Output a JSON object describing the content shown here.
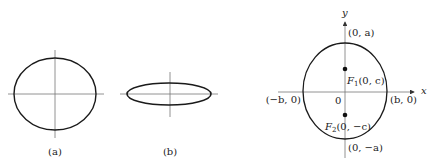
{
  "figures": {
    "a": {
      "label": "(a)",
      "center": [
        55,
        94
      ],
      "rx": 41,
      "ry": 36,
      "axes": {
        "h": [
          8,
          104
        ],
        "v": [
          50,
          138
        ]
      }
    },
    "b": {
      "label": "(b)",
      "center": [
        170,
        94
      ],
      "rx": 42,
      "ry": 11,
      "axes": {
        "h": [
          120,
          218
        ],
        "v": [
          72,
          117
        ]
      }
    },
    "c": {
      "center": [
        345,
        92
      ],
      "rx": 42,
      "ry": 48,
      "x_axis_label": "x",
      "y_axis_label": "y",
      "origin_label": "0",
      "vertex_top": "(0, a)",
      "vertex_bottom": "(0, −a)",
      "covertex_left": "(−b, 0)",
      "covertex_right": "(b, 0)",
      "focus1": {
        "name": "F",
        "sub": "1",
        "coords": "(0, c)",
        "y": 69
      },
      "focus2": {
        "name": "F",
        "sub": "2",
        "coords": "(0, −c)",
        "y": 115
      }
    }
  },
  "colors": {
    "stroke": "#1a1a1a",
    "axis": "#777777"
  }
}
